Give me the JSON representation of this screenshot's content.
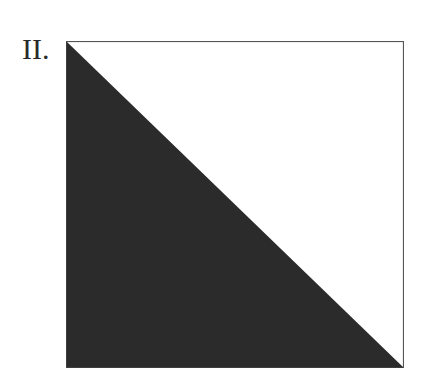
{
  "figure": {
    "label": "II.",
    "shape": "square-split-diagonal",
    "fill_color": "#2b2b2b",
    "border_color": "#555555",
    "background_color": "#ffffff",
    "shaded_region": "lower-left triangle"
  }
}
